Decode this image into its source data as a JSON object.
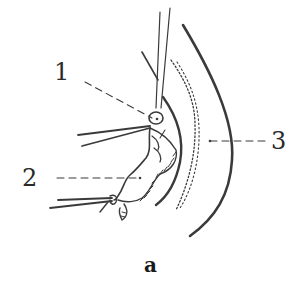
{
  "figure": {
    "caption": "a",
    "labels": [
      {
        "id": "1",
        "text": "1"
      },
      {
        "id": "2",
        "text": "2"
      },
      {
        "id": "3",
        "text": "3"
      }
    ]
  },
  "colors": {
    "ink": "#3a3a3a",
    "background": "#ffffff"
  }
}
